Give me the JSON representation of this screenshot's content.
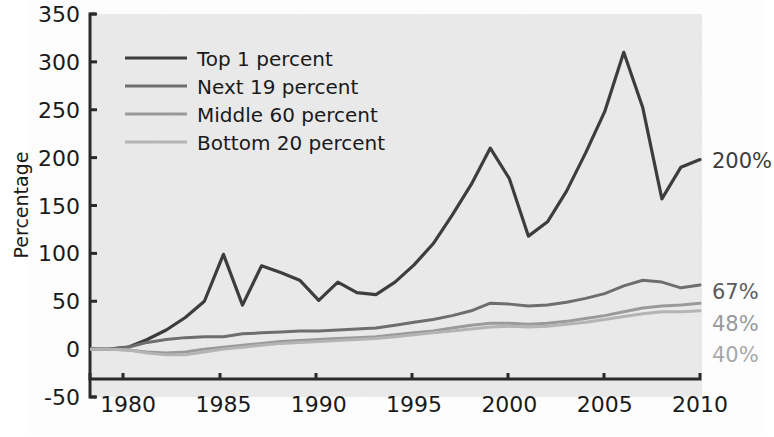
{
  "chart_data": {
    "type": "line",
    "title": "",
    "xlabel": "",
    "ylabel": "Percentage",
    "xlim": [
      1978,
      2010
    ],
    "ylim": [
      -50,
      350
    ],
    "yticks": [
      -50,
      0,
      50,
      100,
      150,
      200,
      250,
      300,
      350
    ],
    "ytick_labels": [
      "-50",
      "0",
      "50",
      "100",
      "150",
      "200",
      "250",
      "300",
      "350"
    ],
    "xticks": [
      1980,
      1985,
      1990,
      1995,
      2000,
      2005,
      2010
    ],
    "xtick_labels": [
      "1980",
      "1985",
      "1990",
      "1995",
      "2000",
      "2005",
      "2010"
    ],
    "grid": false,
    "legend_position": "upper-left",
    "background_color": "#ebebeb",
    "x": [
      1978,
      1979,
      1980,
      1981,
      1982,
      1983,
      1984,
      1985,
      1986,
      1987,
      1988,
      1989,
      1990,
      1991,
      1992,
      1993,
      1994,
      1995,
      1996,
      1997,
      1998,
      1999,
      2000,
      2001,
      2002,
      2003,
      2004,
      2005,
      2006,
      2007,
      2008,
      2009,
      2010
    ],
    "series": [
      {
        "name": "Top 1 percent",
        "color": "#3d3d3d",
        "end_label": "200%",
        "end_label_color": "#3d3d3d",
        "values": [
          0,
          0,
          2,
          10,
          20,
          33,
          50,
          99,
          46,
          87,
          80,
          72,
          51,
          70,
          59,
          57,
          70,
          88,
          110,
          140,
          172,
          210,
          178,
          118,
          133,
          165,
          205,
          248,
          310,
          252,
          157,
          190,
          198
        ]
      },
      {
        "name": "Next 19 percent",
        "color": "#6e6e6e",
        "end_label": "67%",
        "end_label_color": "#5c5c5c",
        "values": [
          0,
          0,
          2,
          7,
          10,
          12,
          13,
          13,
          16,
          17,
          18,
          19,
          19,
          20,
          21,
          22,
          25,
          28,
          31,
          35,
          40,
          48,
          47,
          45,
          46,
          49,
          53,
          58,
          66,
          72,
          70,
          64,
          67
        ]
      },
      {
        "name": "Middle 60 percent",
        "color": "#9a9a9a",
        "end_label": "48%",
        "end_label_color": "#9a9a9a",
        "values": [
          0,
          0,
          -1,
          -3,
          -4,
          -3,
          0,
          2,
          4,
          6,
          8,
          9,
          10,
          11,
          12,
          13,
          15,
          17,
          19,
          22,
          25,
          27,
          27,
          26,
          27,
          29,
          32,
          35,
          39,
          43,
          45,
          46,
          48
        ]
      },
      {
        "name": "Bottom 20 percent",
        "color": "#b4b4b4",
        "end_label": "40%",
        "end_label_color": "#a8a8a8",
        "values": [
          0,
          0,
          -1,
          -4,
          -6,
          -6,
          -3,
          0,
          2,
          4,
          6,
          7,
          8,
          9,
          10,
          11,
          13,
          15,
          17,
          19,
          21,
          23,
          24,
          23,
          24,
          26,
          28,
          31,
          34,
          37,
          39,
          39,
          40
        ]
      }
    ]
  },
  "legend": {
    "items": [
      {
        "label": "Top 1 percent"
      },
      {
        "label": "Next 19 percent"
      },
      {
        "label": "Middle 60 percent"
      },
      {
        "label": "Bottom 20 percent"
      }
    ]
  },
  "axis": {
    "y_title": "Percentage"
  }
}
